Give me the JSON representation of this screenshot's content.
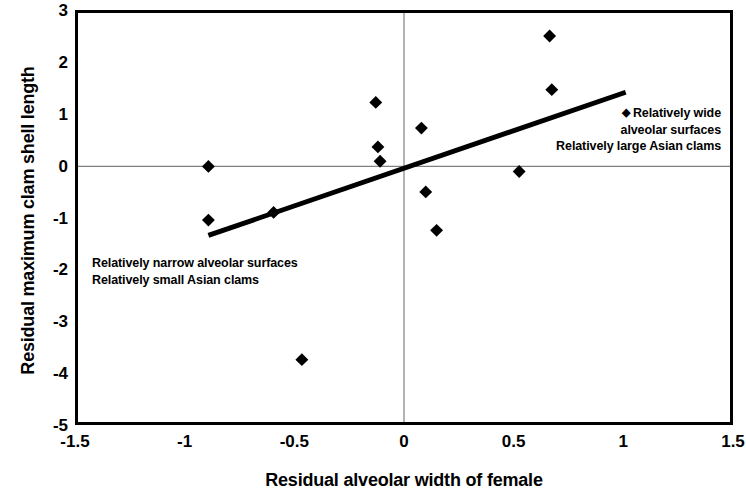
{
  "chart_data": {
    "type": "scatter",
    "title": "",
    "xlabel": "Residual alveolar width of female",
    "ylabel": "Residual maximum clam shell length",
    "xlim": [
      -1.5,
      1.5
    ],
    "ylim": [
      -5,
      3
    ],
    "xticks": [
      "-1.5",
      "-1",
      "-0.5",
      "0",
      "0.5",
      "1",
      "1.5"
    ],
    "xtick_values": [
      -1.5,
      -1,
      -0.5,
      0,
      0.5,
      1,
      1.5
    ],
    "yticks": [
      "3",
      "2",
      "1",
      "0",
      "-1",
      "-2",
      "-3",
      "-4",
      "-5"
    ],
    "ytick_values": [
      3,
      2,
      1,
      0,
      -1,
      -2,
      -3,
      -4,
      -5
    ],
    "grid": false,
    "legend": null,
    "marker": "diamond",
    "marker_color": "#000000",
    "points": [
      {
        "x": -0.9,
        "y": 0.0
      },
      {
        "x": -0.9,
        "y": -1.05
      },
      {
        "x": -0.6,
        "y": -0.9
      },
      {
        "x": -0.47,
        "y": -3.78
      },
      {
        "x": -0.13,
        "y": 1.25
      },
      {
        "x": -0.12,
        "y": 0.38
      },
      {
        "x": -0.11,
        "y": 0.1
      },
      {
        "x": 0.08,
        "y": 0.75
      },
      {
        "x": 0.1,
        "y": -0.5
      },
      {
        "x": 0.15,
        "y": -1.25
      },
      {
        "x": 0.53,
        "y": -0.1
      },
      {
        "x": 0.67,
        "y": 2.55
      },
      {
        "x": 0.68,
        "y": 1.5
      }
    ],
    "trendline": {
      "type": "linear",
      "x_start": -0.9,
      "y_start": -1.35,
      "x_end": 1.02,
      "y_end": 1.45,
      "color": "#000000",
      "width": 5
    },
    "reference_lines": [
      {
        "axis": "y",
        "value": 0,
        "color": "#808080"
      },
      {
        "axis": "x",
        "value": 0,
        "color": "#808080"
      }
    ],
    "annotations": [
      {
        "id": "annotation-lower-left",
        "lines": [
          "Relatively narrow alveolar surfaces",
          "Relatively small Asian clams"
        ],
        "position": "lower-left"
      },
      {
        "id": "annotation-upper-right",
        "marker": "◆",
        "lines": [
          "Relatively wide",
          "alveolar surfaces",
          "Relatively large Asian clams"
        ],
        "position": "upper-right"
      }
    ]
  }
}
